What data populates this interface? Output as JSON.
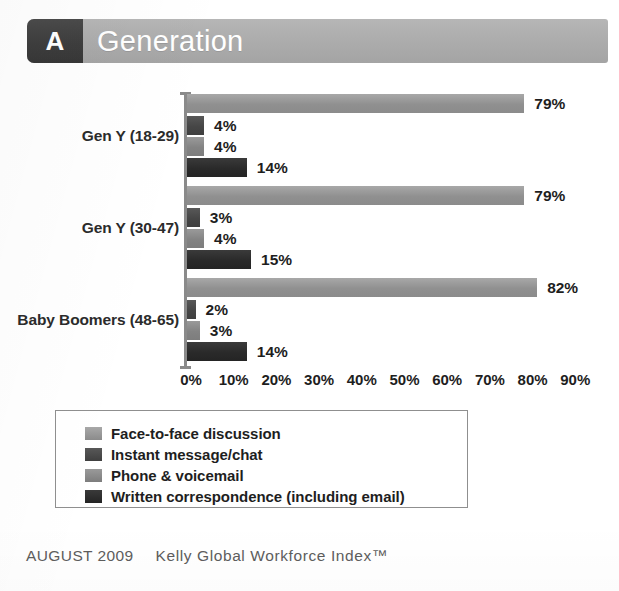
{
  "header": {
    "badge": "A",
    "title": "Generation"
  },
  "chart_data": {
    "type": "bar",
    "orientation": "horizontal",
    "grouped": true,
    "title": "Generation",
    "xlabel": "",
    "ylabel": "",
    "xlim": [
      0,
      90
    ],
    "xticks": [
      "0%",
      "10%",
      "20%",
      "30%",
      "40%",
      "50%",
      "60%",
      "70%",
      "80%",
      "90%"
    ],
    "xtick_values": [
      0,
      10,
      20,
      30,
      40,
      50,
      60,
      70,
      80,
      90
    ],
    "grid": false,
    "legend_position": "bottom",
    "categories": [
      "Gen Y (18-29)",
      "Gen Y (30-47)",
      "Baby Boomers (48-65)"
    ],
    "series": [
      {
        "name": "Face-to-face discussion",
        "color": "#8b8b8b",
        "values": [
          79,
          79,
          82
        ],
        "labels": [
          "79%",
          "79%",
          "82%"
        ]
      },
      {
        "name": "Instant message/chat",
        "color": "#3f3f3f",
        "values": [
          4,
          3,
          2
        ],
        "labels": [
          "4%",
          "3%",
          "2%"
        ]
      },
      {
        "name": "Phone & voicemail",
        "color": "#7d7d7d",
        "values": [
          4,
          4,
          3
        ],
        "labels": [
          "4%",
          "4%",
          "3%"
        ]
      },
      {
        "name": "Written correspondence (including email)",
        "color": "#242424",
        "values": [
          14,
          15,
          14
        ],
        "labels": [
          "14%",
          "15%",
          "14%"
        ]
      }
    ]
  },
  "footer": {
    "date": "AUGUST 2009",
    "brand": "Kelly Global Workforce Index™"
  }
}
